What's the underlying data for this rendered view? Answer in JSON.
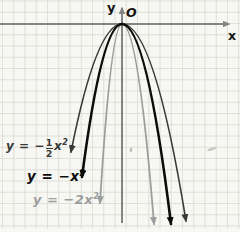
{
  "figure": {
    "origin_label": "O",
    "x_axis_label": "x",
    "y_axis_label": "y",
    "background_color": "#f7f7f3",
    "grid_color": "#dbdbd3",
    "axis_color": "#848484"
  },
  "chart_data": {
    "type": "line",
    "title": "",
    "xlabel": "x",
    "ylabel": "y",
    "grid": true,
    "vertex": [
      0,
      0
    ],
    "opens": "down",
    "series": [
      {
        "name": "y = -(1/2)x²",
        "coefficient": -0.5,
        "color": "#3a3a3a",
        "x": [
          -3,
          -2,
          -1,
          0,
          1,
          2,
          3
        ],
        "values": [
          -4.5,
          -2,
          -0.5,
          0,
          -0.5,
          -2,
          -4.5
        ]
      },
      {
        "name": "y = -x²",
        "coefficient": -1,
        "color": "#0c0c0c",
        "x": [
          -3,
          -2,
          -1,
          0,
          1,
          2,
          3
        ],
        "values": [
          -9,
          -4,
          -1,
          0,
          -1,
          -4,
          -9
        ]
      },
      {
        "name": "y = -2x²",
        "coefficient": -2,
        "color": "#9d9d9d",
        "x": [
          -3,
          -2,
          -1,
          0,
          1,
          2,
          3
        ],
        "values": [
          -18,
          -8,
          -2,
          0,
          -2,
          -8,
          -18
        ]
      }
    ]
  },
  "labels": {
    "half": {
      "pre": "y = −",
      "num": "1",
      "den": "2",
      "var": "x",
      "exp": "2"
    },
    "one": {
      "base": "y = −x",
      "exp": "2"
    },
    "two": {
      "base": "y = −2x",
      "exp": "2"
    }
  },
  "render": {
    "width": 240,
    "height": 232,
    "vertex": [
      122,
      24
    ],
    "grid": {
      "spacing": 11.25,
      "offset_x": 2.5,
      "offset_y": 1.0,
      "bottom": 229,
      "stroke_width": 0.8
    },
    "axes": {
      "x": {
        "x1": 0,
        "y1": 24,
        "x2": 229,
        "y2": 24,
        "width": 2.2
      },
      "y": {
        "x1": 122,
        "y1": 223,
        "x2": 122,
        "y2": 8,
        "width": 2.0
      }
    },
    "curves": [
      {
        "id": "two",
        "color": "#9d9d9d",
        "width": 1.8,
        "branches": [
          {
            "side": "left",
            "c": [
              111,
              24
            ],
            "e": [
              100,
              203
            ]
          },
          {
            "side": "right",
            "c": [
              138,
              24
            ],
            "e": [
              154,
              224
            ]
          }
        ]
      },
      {
        "id": "half",
        "color": "#3a3a3a",
        "width": 1.6,
        "branches": [
          {
            "side": "left",
            "c": [
              96.5,
              24
            ],
            "e": [
              71,
              152
            ]
          },
          {
            "side": "right",
            "c": [
              154,
              24
            ],
            "e": [
              186,
              221
            ]
          }
        ]
      },
      {
        "id": "one",
        "color": "#0c0c0c",
        "width": 2.6,
        "branches": [
          {
            "side": "left",
            "c": [
              102,
              24
            ],
            "e": [
              82,
              177
            ]
          },
          {
            "side": "right",
            "c": [
              146.5,
              24
            ],
            "e": [
              171,
              224
            ]
          }
        ]
      }
    ],
    "artifacts": [
      {
        "x": 212,
        "y": 149,
        "rx": 5,
        "ry": 1.2,
        "rot": -18,
        "color": "#c9c9c0"
      },
      {
        "x": 131,
        "y": 150,
        "rx": 1.4,
        "ry": 2.2,
        "rot": 12,
        "color": "#c2c2ba"
      }
    ]
  }
}
